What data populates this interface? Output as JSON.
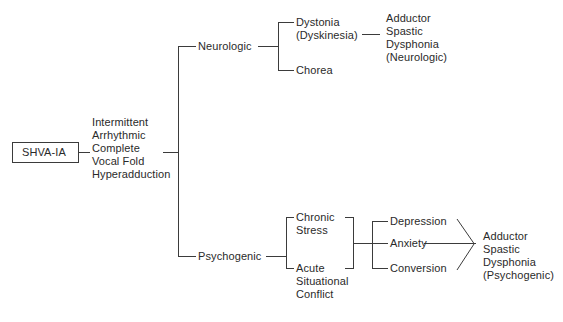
{
  "diagram": {
    "type": "flowchart-tree",
    "title": "",
    "background_color": "#ffffff",
    "line_color": "#3b3b3b",
    "text_color": "#2a2a2a",
    "root": {
      "id": "shva-ia",
      "label": "SHVA-IA",
      "boxed": true
    },
    "description_node": {
      "id": "description",
      "lines": [
        "Intermittent",
        "Arrhythmic",
        "Complete",
        "Vocal Fold",
        "Hyperadduction"
      ],
      "text": "Intermittent\nArrhythmic\nComplete\nVocal Fold\nHyperadduction"
    },
    "branches": [
      {
        "id": "neurologic",
        "label": "Neurologic",
        "children": [
          {
            "id": "dystonia",
            "lines": [
              "Dystonia",
              "(Dyskinesia)"
            ],
            "text": "Dystonia\n(Dyskinesia)"
          },
          {
            "id": "chorea",
            "lines": [
              "Chorea"
            ],
            "text": "Chorea"
          }
        ],
        "outcome": {
          "id": "outcome-neurologic",
          "lines": [
            "Adductor",
            "Spastic",
            "Dysphonia",
            "(Neurologic)"
          ],
          "text": "Adductor\nSpastic\nDysphonia\n(Neurologic)"
        }
      },
      {
        "id": "psychogenic",
        "label": "Psychogenic",
        "children": [
          {
            "id": "chronic-stress",
            "lines": [
              "Chronic",
              "Stress"
            ],
            "text": "Chronic\nStress"
          },
          {
            "id": "acute-situational-conflict",
            "lines": [
              "Acute",
              "Situational",
              "Conflict"
            ],
            "text": "Acute\nSituational\nConflict"
          }
        ],
        "mediators": [
          {
            "id": "depression",
            "label": "Depression"
          },
          {
            "id": "anxiety",
            "label": "Anxiety"
          },
          {
            "id": "conversion",
            "label": "Conversion"
          }
        ],
        "outcome": {
          "id": "outcome-psychogenic",
          "lines": [
            "Adductor",
            "Spastic",
            "Dysphonia",
            "(Psychogenic)"
          ],
          "text": "Adductor\nSpastic\nDysphonia\n(Psychogenic)"
        }
      }
    ]
  }
}
